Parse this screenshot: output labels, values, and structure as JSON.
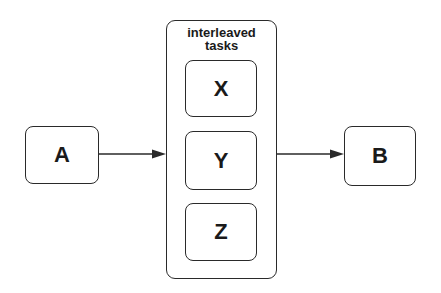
{
  "diagram": {
    "type": "flow",
    "nodes": {
      "a": {
        "label": "A"
      },
      "b": {
        "label": "B"
      },
      "group": {
        "title_line1": "interleaved",
        "title_line2": "tasks",
        "children": [
          {
            "label": "X"
          },
          {
            "label": "Y"
          },
          {
            "label": "Z"
          }
        ]
      }
    },
    "edges": [
      {
        "from": "A",
        "to": "interleaved tasks"
      },
      {
        "from": "interleaved tasks",
        "to": "B"
      }
    ],
    "colors": {
      "stroke": "#2a2a2a",
      "text": "#1a1a1a",
      "background": "#ffffff"
    }
  }
}
